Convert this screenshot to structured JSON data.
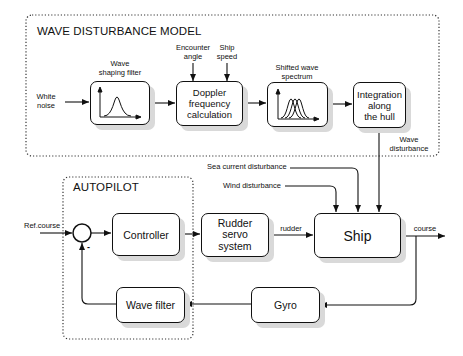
{
  "wave_model": {
    "title": "WAVE DISTURBANCE MODEL",
    "input_label_line1": "White",
    "input_label_line2": "noise",
    "shaping_filter": {
      "caption_line1": "Wave",
      "caption_line2": "shaping filter",
      "icon": "single-peak-spectrum-icon"
    },
    "doppler": {
      "line1": "Doppler",
      "line2": "frequency",
      "line3": "calculation",
      "input1_line1": "Encounter",
      "input1_line2": "angle",
      "input2_line1": "Ship",
      "input2_line2": "speed"
    },
    "shifted_spectrum": {
      "caption_line1": "Shifted wave",
      "caption_line2": "spectrum",
      "icon": "multi-peak-spectrum-icon"
    },
    "integration": {
      "line1": "Integration",
      "line2": "along",
      "line3": "the hull"
    },
    "output_label_line1": "Wave",
    "output_label_line2": "disturbance"
  },
  "autopilot": {
    "title": "AUTOPILOT",
    "controller": "Controller",
    "wave_filter": "Wave filter",
    "summing_minus": "-"
  },
  "plant": {
    "ref_course": "Ref.course",
    "rudder_servo": {
      "line1": "Rudder",
      "line2": "servo",
      "line3": "system"
    },
    "rudder_signal": "rudder",
    "ship": "Ship",
    "course_signal": "course",
    "gyro": "Gyro",
    "sea_current": "Sea current disturbance",
    "wind": "Wind disturbance"
  }
}
